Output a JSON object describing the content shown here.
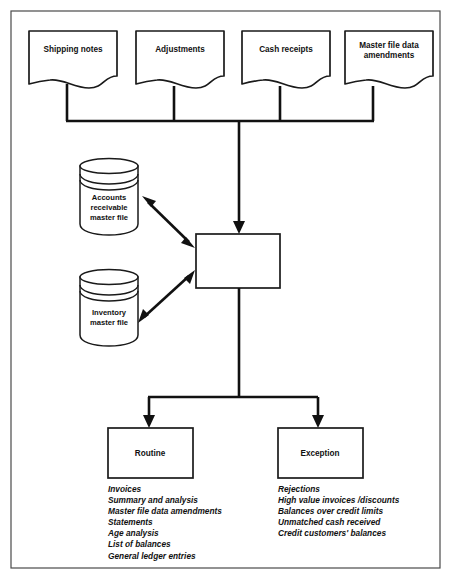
{
  "diagram": {
    "inputs": [
      {
        "label": "Shipping notes",
        "icon": "document-icon"
      },
      {
        "label": "Adjustments",
        "icon": "document-icon"
      },
      {
        "label": "Cash receipts",
        "icon": "document-icon"
      },
      {
        "label": "Master file data amendments",
        "line1": "Master file data",
        "line2": "amendments",
        "icon": "document-icon"
      }
    ],
    "datastores": [
      {
        "label": "Accounts receivable master file",
        "line1": "Accounts",
        "line2": "receivable",
        "line3": "master file",
        "icon": "database-cylinder-icon"
      },
      {
        "label": "Inventory master file",
        "line1": "Inventory",
        "line2": "master file",
        "line3": "",
        "icon": "database-cylinder-icon"
      }
    ],
    "process": {
      "label": ""
    },
    "outputs": [
      {
        "label": "Routine",
        "items": [
          "Invoices",
          "Summary and analysis",
          "Master file data amendments",
          "Statements",
          "Age analysis",
          "List of balances",
          "General ledger entries"
        ]
      },
      {
        "label": "Exception",
        "items": [
          "Rejections",
          "High value invoices /discounts",
          "Balances over credit limits",
          "Unmatched cash received",
          "Credit customers' balances"
        ]
      }
    ],
    "colors": {
      "line": "#111111",
      "frame": "#4a4a4a",
      "background": "#ffffff"
    }
  }
}
